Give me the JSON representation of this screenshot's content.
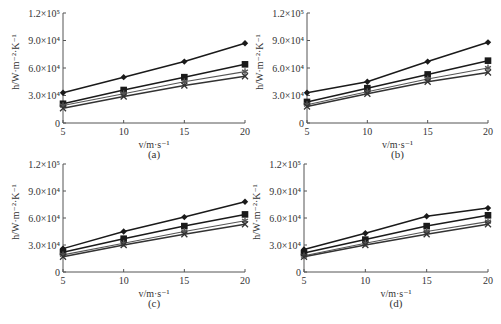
{
  "chart_data": [
    {
      "type": "line",
      "panel_label": "(a)",
      "xlabel": "v/m·s⁻¹",
      "ylabel": "h/W·m⁻²·K⁻¹",
      "x": [
        5,
        10,
        15,
        20
      ],
      "xticks": [
        "5",
        "10",
        "15",
        "20"
      ],
      "yticks": [
        "0",
        "3.0×10⁴",
        "6.0×10⁴",
        "9.0×10⁴",
        "1.2×10⁵"
      ],
      "xlim": [
        5,
        20
      ],
      "ylim": [
        0,
        120000
      ],
      "grid": false,
      "series": [
        {
          "marker": "diamond",
          "values": [
            33000,
            50000,
            67000,
            87000
          ]
        },
        {
          "marker": "square",
          "values": [
            21000,
            36000,
            50000,
            64000
          ]
        },
        {
          "marker": "star",
          "values": [
            19000,
            32000,
            45000,
            56000
          ]
        },
        {
          "marker": "x",
          "values": [
            16000,
            29000,
            41000,
            51000
          ]
        }
      ]
    },
    {
      "type": "line",
      "panel_label": "(b)",
      "xlabel": "v/m·s⁻¹",
      "ylabel": "h/W·m⁻²·K⁻¹",
      "x": [
        5,
        10,
        15,
        20
      ],
      "xticks": [
        "5",
        "10",
        "15",
        "20"
      ],
      "yticks": [
        "0",
        "3.0×10⁴",
        "6.0×10⁴",
        "9.0×10⁴",
        "1.2×10⁵"
      ],
      "xlim": [
        5,
        20
      ],
      "ylim": [
        0,
        120000
      ],
      "grid": false,
      "series": [
        {
          "marker": "diamond",
          "values": [
            33000,
            45000,
            67000,
            88000
          ]
        },
        {
          "marker": "square",
          "values": [
            23000,
            38000,
            53000,
            68000
          ]
        },
        {
          "marker": "star",
          "values": [
            20000,
            34000,
            48000,
            60000
          ]
        },
        {
          "marker": "x",
          "values": [
            18000,
            32000,
            45000,
            55000
          ]
        }
      ]
    },
    {
      "type": "line",
      "panel_label": "(c)",
      "xlabel": "v/m·s⁻¹",
      "ylabel": "h/W·m⁻²·K⁻¹",
      "x": [
        5,
        10,
        15,
        20
      ],
      "xticks": [
        "5",
        "10",
        "15",
        "20"
      ],
      "yticks": [
        "0",
        "3.0×10⁴",
        "6.0×10⁴",
        "9.0×10⁴",
        "1.2×10⁵"
      ],
      "xlim": [
        5,
        20
      ],
      "ylim": [
        0,
        120000
      ],
      "grid": false,
      "series": [
        {
          "marker": "diamond",
          "values": [
            26000,
            45000,
            61000,
            78000
          ]
        },
        {
          "marker": "square",
          "values": [
            22000,
            37000,
            51000,
            64000
          ]
        },
        {
          "marker": "star",
          "values": [
            19000,
            32000,
            45000,
            57000
          ]
        },
        {
          "marker": "x",
          "values": [
            17000,
            30000,
            42000,
            53000
          ]
        }
      ]
    },
    {
      "type": "line",
      "panel_label": "(d)",
      "xlabel": "v/m·s⁻¹",
      "ylabel": "h/W·m⁻²·K⁻¹",
      "x": [
        5,
        10,
        15,
        20
      ],
      "xticks": [
        "5",
        "10",
        "15",
        "20"
      ],
      "yticks": [
        "0",
        "3.0×10⁴",
        "6.0×10⁴",
        "9.0×10⁴",
        "1.2×10⁵"
      ],
      "xlim": [
        5,
        20
      ],
      "ylim": [
        0,
        120000
      ],
      "grid": false,
      "series": [
        {
          "marker": "diamond",
          "values": [
            25000,
            43000,
            62000,
            71000
          ]
        },
        {
          "marker": "square",
          "values": [
            21000,
            36000,
            51000,
            63000
          ]
        },
        {
          "marker": "star",
          "values": [
            18000,
            32000,
            45000,
            56000
          ]
        },
        {
          "marker": "x",
          "values": [
            17000,
            30000,
            42000,
            53000
          ]
        }
      ]
    }
  ],
  "colors": {
    "axis": "#555555",
    "series": [
      "#1a1a1a",
      "#1a1a1a",
      "#555555",
      "#333333"
    ]
  }
}
